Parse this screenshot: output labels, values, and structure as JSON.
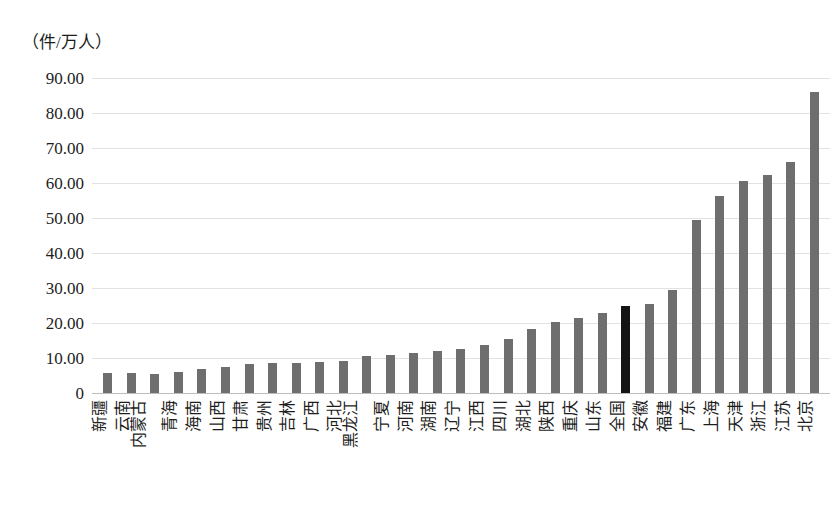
{
  "chart_data": {
    "type": "bar",
    "title": "",
    "subtitle": "",
    "xlabel": "",
    "ylabel": "（件/万人）",
    "unit_caption": "（件/万人）",
    "ylim": [
      0,
      90
    ],
    "grid": true,
    "legend": null,
    "ytick_labels": [
      "90.00",
      "80.00",
      "70.00",
      "60.00",
      "50.00",
      "40.00",
      "30.00",
      "20.00",
      "10.00",
      "0"
    ],
    "ytick_values": [
      90,
      80,
      70,
      60,
      50,
      40,
      30,
      20,
      10,
      0
    ],
    "highlight_category": "全国",
    "colors": {
      "bar": "#6e6e6e",
      "highlight_bar": "#141414",
      "grid": "#e2e2e2",
      "text": "#1d1d1d"
    },
    "categories": [
      "新疆",
      "云南",
      "内蒙古",
      "青海",
      "海南",
      "山西",
      "甘肃",
      "贵州",
      "吉林",
      "广西",
      "河北",
      "黑龙江",
      "宁夏",
      "河南",
      "湖南",
      "辽宁",
      "江西",
      "四川",
      "湖北",
      "陕西",
      "重庆",
      "山东",
      "全国",
      "安徽",
      "福建",
      "广东",
      "上海",
      "天津",
      "浙江",
      "江苏",
      "北京"
    ],
    "values": [
      5.6,
      5.8,
      5.5,
      5.9,
      7.0,
      7.3,
      8.2,
      8.5,
      8.6,
      8.8,
      9.2,
      10.6,
      10.9,
      11.5,
      11.9,
      12.5,
      13.8,
      15.4,
      18.3,
      20.3,
      21.4,
      22.9,
      25.0,
      25.5,
      29.4,
      49.3,
      56.3,
      60.5,
      62.4,
      66.0,
      86.1
    ],
    "highlight_flags": [
      false,
      false,
      false,
      false,
      false,
      false,
      false,
      false,
      false,
      false,
      false,
      false,
      false,
      false,
      false,
      false,
      false,
      false,
      false,
      false,
      false,
      false,
      true,
      false,
      false,
      false,
      false,
      false,
      false,
      false,
      false
    ]
  }
}
